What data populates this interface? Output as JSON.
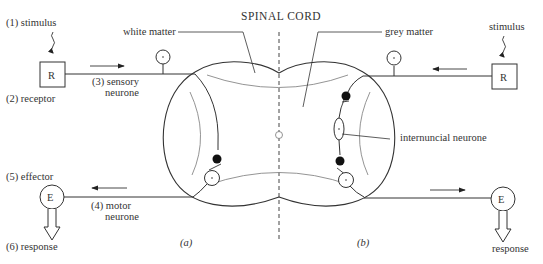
{
  "diagram": {
    "title": "SPINAL CORD",
    "colors": {
      "stroke": "#333333",
      "faint": "#888888",
      "text": "#333333",
      "background": "#ffffff",
      "fill_dark": "#111111"
    },
    "left_arc": {
      "stimulus": "(1)  stimulus",
      "receptor_label": "(2) receptor",
      "receptor_glyph": "R",
      "sensory_num": "(3) sensory",
      "sensory_word": "neurone",
      "effector": "(5) effector",
      "effector_glyph": "E",
      "motor_num": "(4) motor",
      "motor_word": "neurone",
      "response": "(6) response",
      "caption": "(a)"
    },
    "right_arc": {
      "stimulus": "stimulus",
      "receptor_glyph": "R",
      "effector_glyph": "E",
      "response": "response",
      "internuncial": "internuncial neurone",
      "caption": "(b)"
    },
    "regions": {
      "white_matter": "white matter",
      "grey_matter": "grey matter"
    }
  }
}
